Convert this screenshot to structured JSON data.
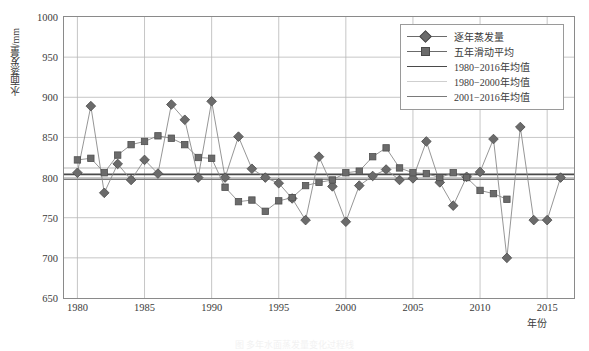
{
  "chart_data": {
    "type": "line",
    "title": "",
    "xlabel": "年份",
    "ylabel": "水面蒸发量/mm",
    "xlim": [
      1979,
      2017
    ],
    "ylim": [
      650,
      1000
    ],
    "yticks": [
      650,
      700,
      750,
      800,
      850,
      900,
      950,
      1000
    ],
    "xticks": [
      1980,
      1985,
      1990,
      1995,
      2000,
      2005,
      2010,
      2015
    ],
    "grid": true,
    "legend_position": "top-right",
    "x": [
      1980,
      1981,
      1982,
      1983,
      1984,
      1985,
      1986,
      1987,
      1988,
      1989,
      1990,
      1991,
      1992,
      1993,
      1994,
      1995,
      1996,
      1997,
      1998,
      1999,
      2000,
      2001,
      2002,
      2003,
      2004,
      2005,
      2006,
      2007,
      2008,
      2009,
      2010,
      2011,
      2012,
      2013,
      2014,
      2015,
      2016
    ],
    "series": [
      {
        "name": "逐年蒸发量",
        "marker": "diamond",
        "color": "#6b6b6b",
        "values": [
          806,
          889,
          781,
          817,
          797,
          822,
          805,
          891,
          872,
          800,
          895,
          800,
          851,
          811,
          800,
          793,
          774,
          747,
          826,
          789,
          745,
          790,
          802,
          810,
          797,
          799,
          845,
          794,
          765,
          801,
          807,
          848,
          700,
          863,
          747,
          747,
          800
        ]
      },
      {
        "name": "五年滑动平均",
        "marker": "square",
        "color": "#6b6b6b",
        "values": [
          822,
          824,
          806,
          828,
          841,
          845,
          852,
          849,
          841,
          825,
          824,
          788,
          770,
          772,
          758,
          771,
          775,
          790,
          794,
          797,
          806,
          808,
          826,
          837,
          812,
          806,
          805,
          800,
          806,
          800,
          784,
          780,
          773,
          null,
          null,
          null,
          null
        ]
      }
    ],
    "hlines": [
      {
        "name": "1980−2016年均值",
        "value": 804,
        "color": "#4a4a4a",
        "width": 1.6
      },
      {
        "name": "1980−2000年均值",
        "value": 812,
        "color": "#cfcfcf",
        "width": 1.6
      },
      {
        "name": "2001−2016年均值",
        "value": 798,
        "color": "#7a7a7a",
        "width": 1.6
      }
    ]
  },
  "legend": {
    "items": [
      {
        "label": "逐年蒸发量",
        "kind": "marker-line",
        "marker": "diamond",
        "color": "#6b6b6b"
      },
      {
        "label": "五年滑动平均",
        "kind": "marker-line",
        "marker": "square",
        "color": "#6b6b6b"
      },
      {
        "label": "1980−2016年均值",
        "kind": "line",
        "marker": "none",
        "color": "#4a4a4a"
      },
      {
        "label": "1980−2000年均值",
        "kind": "line",
        "marker": "none",
        "color": "#cfcfcf"
      },
      {
        "label": "2001−2016年均值",
        "kind": "line",
        "marker": "none",
        "color": "#7a7a7a"
      }
    ]
  },
  "caption": "图 多年水面蒸发量变化过程线"
}
